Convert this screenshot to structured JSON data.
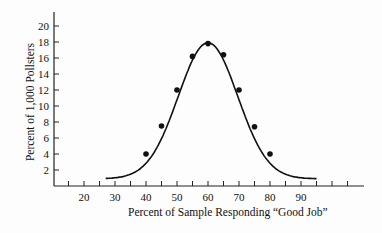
{
  "chart_data": {
    "type": "line",
    "title": "",
    "xlabel": "Percent of Sample Responding “Good Job”",
    "ylabel": "Percent of 1,000 Pollsters",
    "x_ticks": [
      20,
      30,
      40,
      50,
      60,
      70,
      80,
      90
    ],
    "y_ticks": [
      2,
      4,
      6,
      8,
      10,
      12,
      14,
      16,
      18,
      20
    ],
    "xlim": [
      10,
      110
    ],
    "ylim": [
      0,
      22
    ],
    "grid": false,
    "legend": null,
    "series": [
      {
        "name": "sampling distribution curve",
        "style": "smooth bell curve with markers",
        "x": [
          40,
          45,
          50,
          55,
          60,
          65,
          70,
          75,
          80
        ],
        "values": [
          4,
          7.5,
          12,
          16.2,
          17.8,
          16.4,
          12,
          7.4,
          4
        ]
      }
    ],
    "curve_range": [
      27,
      95
    ]
  }
}
